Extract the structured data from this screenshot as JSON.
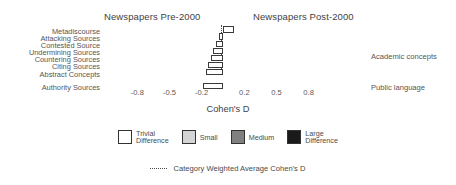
{
  "panels": {
    "left_title": "Newspapers Pre-2000",
    "right_title": "Newspapers Post-2000"
  },
  "group_annotations": {
    "academic": "Academic concepts",
    "public": "Public language"
  },
  "axis": {
    "xlabel": "Cohen's D",
    "ticks": [
      "-0.8",
      "-0.5",
      "-0.2",
      "0.2",
      "0.5",
      "0.8"
    ]
  },
  "legend": {
    "items": [
      {
        "label": "Trivial\nDifference",
        "key": "trivial",
        "color": "#ffffff"
      },
      {
        "label": "Small",
        "key": "small",
        "color": "#d4d4d4"
      },
      {
        "label": "Medium",
        "key": "medium",
        "color": "#808080"
      },
      {
        "label": "Large\nDifference",
        "key": "large",
        "color": "#1a1a1a"
      }
    ]
  },
  "footnote": {
    "text": "Category Weighted Average Cohen's D"
  },
  "chart_data": {
    "type": "bar",
    "orientation": "horizontal",
    "title": "",
    "xlabel": "Cohen's D",
    "ylabel": "",
    "xlim": [
      -1.0,
      1.0
    ],
    "xticks": [
      -0.8,
      -0.5,
      -0.2,
      0.2,
      0.5,
      0.8
    ],
    "grid": false,
    "legend_position": "bottom",
    "categories": [
      "Metadiscourse",
      "Attacking Sources",
      "Contested Source",
      "Undermining Sources",
      "Countering Sources",
      "Citing Sources",
      "Abstract Concepts",
      "Authority Sources"
    ],
    "values": [
      0.1,
      -0.04,
      -0.07,
      -0.09,
      -0.11,
      -0.14,
      -0.16,
      -0.19
    ],
    "effect_sizes": [
      "trivial",
      "trivial",
      "trivial",
      "trivial",
      "trivial",
      "trivial",
      "trivial",
      "trivial"
    ],
    "groups": [
      {
        "name": "Academic concepts",
        "categories": [
          "Metadiscourse",
          "Attacking Sources",
          "Contested Source",
          "Undermining Sources",
          "Countering Sources",
          "Citing Sources",
          "Abstract Concepts"
        ]
      },
      {
        "name": "Public language",
        "categories": [
          "Authority Sources"
        ]
      }
    ],
    "weighted_average_line": -0.02,
    "annotations": [
      "Newspapers Pre-2000",
      "Newspapers Post-2000"
    ]
  }
}
